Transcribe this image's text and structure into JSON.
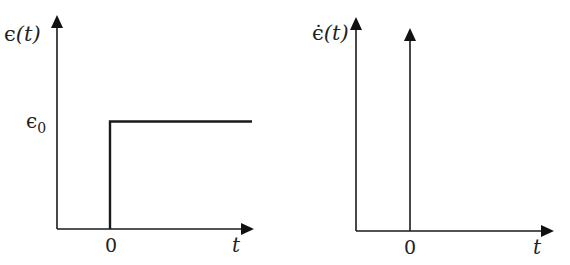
{
  "figure": {
    "colors": {
      "ink": "#1a1a1a",
      "background": "#ffffff"
    },
    "panels": [
      {
        "id": "left",
        "description": "Step function strain",
        "y_label": {
          "symbol": "ϵ",
          "arg": "(t)"
        },
        "x_label": "t",
        "x_tick": "0",
        "y_tick": {
          "symbol": "ϵ",
          "sub": "0"
        },
        "curve": "step"
      },
      {
        "id": "right",
        "description": "Impulse (delta) strain rate",
        "y_label": {
          "symbol": "ϵ̇",
          "arg": "(t)"
        },
        "x_label": "t",
        "x_tick": "0",
        "curve": "impulse"
      }
    ]
  }
}
